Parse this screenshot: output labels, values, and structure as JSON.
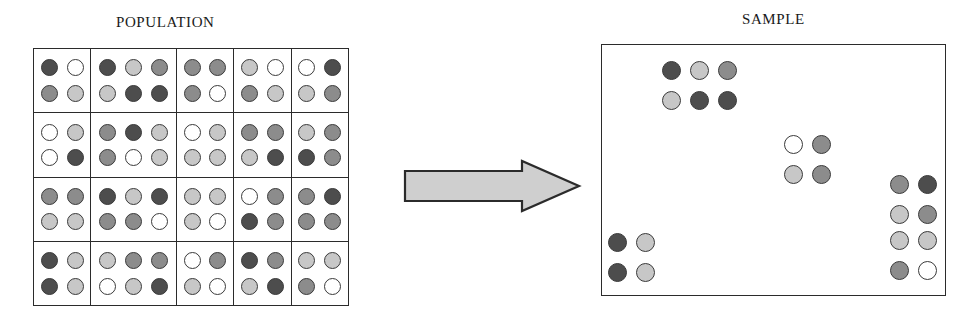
{
  "labels": {
    "population": "POPULATION",
    "sample": "SAMPLE"
  },
  "colors": {
    "shade_dark": "#4d4d4d",
    "shade_mid": "#8c8c8c",
    "shade_light": "#c7c7c7",
    "shade_white": "#ffffff",
    "outline": "#3a3a3a",
    "grid_line": "#2b2b2b",
    "arrow_fill": "#cfcfcf",
    "arrow_stroke": "#2b2b2b",
    "background": "#ffffff"
  },
  "chart_data": {
    "type": "diagram",
    "population": {
      "label": "POPULATION",
      "rows": 4,
      "columns": 5,
      "cluster_widths": [
        2,
        3,
        2,
        2,
        2
      ],
      "total_clusters": 20,
      "units_per_cluster_row": 2,
      "shade_legend": [
        "dark",
        "mid",
        "light",
        "white"
      ],
      "clusters": [
        [
          {
            "id": "r1c1",
            "cols": 2,
            "cells": [
              [
                "dark",
                "white"
              ],
              [
                "mid",
                "light"
              ]
            ]
          },
          {
            "id": "r1c2",
            "cols": 3,
            "cells": [
              [
                "dark",
                "light",
                "mid"
              ],
              [
                "light",
                "dark",
                "dark"
              ]
            ]
          },
          {
            "id": "r1c3",
            "cols": 2,
            "cells": [
              [
                "mid",
                "mid"
              ],
              [
                "mid",
                "white"
              ]
            ]
          },
          {
            "id": "r1c4",
            "cols": 2,
            "cells": [
              [
                "light",
                "white"
              ],
              [
                "mid",
                "light"
              ]
            ]
          },
          {
            "id": "r1c5",
            "cols": 2,
            "cells": [
              [
                "white",
                "dark"
              ],
              [
                "light",
                "mid"
              ]
            ]
          }
        ],
        [
          {
            "id": "r2c1",
            "cols": 2,
            "cells": [
              [
                "white",
                "light"
              ],
              [
                "white",
                "dark"
              ]
            ]
          },
          {
            "id": "r2c2",
            "cols": 3,
            "cells": [
              [
                "mid",
                "dark",
                "light"
              ],
              [
                "mid",
                "white",
                "light"
              ]
            ]
          },
          {
            "id": "r2c3",
            "cols": 2,
            "cells": [
              [
                "white",
                "light"
              ],
              [
                "light",
                "light"
              ]
            ]
          },
          {
            "id": "r2c4",
            "cols": 2,
            "cells": [
              [
                "mid",
                "mid"
              ],
              [
                "light",
                "dark"
              ]
            ]
          },
          {
            "id": "r2c5",
            "cols": 2,
            "cells": [
              [
                "light",
                "mid"
              ],
              [
                "dark",
                "mid"
              ]
            ]
          }
        ],
        [
          {
            "id": "r3c1",
            "cols": 2,
            "cells": [
              [
                "mid",
                "mid"
              ],
              [
                "light",
                "light"
              ]
            ]
          },
          {
            "id": "r3c2",
            "cols": 3,
            "cells": [
              [
                "dark",
                "light",
                "dark"
              ],
              [
                "mid",
                "mid",
                "white"
              ]
            ]
          },
          {
            "id": "r3c3",
            "cols": 2,
            "cells": [
              [
                "light",
                "light"
              ],
              [
                "light",
                "white"
              ]
            ]
          },
          {
            "id": "r3c4",
            "cols": 2,
            "cells": [
              [
                "white",
                "mid"
              ],
              [
                "dark",
                "mid"
              ]
            ]
          },
          {
            "id": "r3c5",
            "cols": 2,
            "cells": [
              [
                "mid",
                "dark"
              ],
              [
                "mid",
                "mid"
              ]
            ]
          }
        ],
        [
          {
            "id": "r4c1",
            "cols": 2,
            "cells": [
              [
                "dark",
                "light"
              ],
              [
                "dark",
                "light"
              ]
            ]
          },
          {
            "id": "r4c2",
            "cols": 3,
            "cells": [
              [
                "light",
                "mid",
                "mid"
              ],
              [
                "white",
                "light",
                "dark"
              ]
            ]
          },
          {
            "id": "r4c3",
            "cols": 2,
            "cells": [
              [
                "white",
                "mid"
              ],
              [
                "light",
                "white"
              ]
            ]
          },
          {
            "id": "r4c4",
            "cols": 2,
            "cells": [
              [
                "dark",
                "mid"
              ],
              [
                "light",
                "dark"
              ]
            ]
          },
          {
            "id": "r4c5",
            "cols": 2,
            "cells": [
              [
                "light",
                "light"
              ],
              [
                "mid",
                "white"
              ]
            ]
          }
        ]
      ]
    },
    "arrow": {
      "direction": "right",
      "fill": "#cfcfcf",
      "stroke": "#2b2b2b"
    },
    "sample": {
      "label": "SAMPLE",
      "selected_clusters": 5,
      "groups": [
        {
          "id": "sample-cluster-top-left",
          "source": "r1c2",
          "x": 60,
          "y": 16,
          "cells": [
            [
              "dark",
              "light",
              "mid"
            ],
            [
              "light",
              "dark",
              "dark"
            ]
          ]
        },
        {
          "id": "sample-cluster-middle",
          "source": "r2c3",
          "x": 182,
          "y": 90,
          "cells": [
            [
              "white",
              "mid"
            ],
            [
              "light",
              "mid"
            ]
          ]
        },
        {
          "id": "sample-cluster-bottom-left",
          "source": "r4c1",
          "x": 6,
          "y": 188,
          "cells": [
            [
              "dark",
              "light"
            ],
            [
              "dark",
              "light"
            ]
          ]
        },
        {
          "id": "sample-cluster-right-upper",
          "source": "r3c5",
          "x": 288,
          "y": 130,
          "cells": [
            [
              "mid",
              "dark"
            ],
            [
              "light",
              "mid"
            ]
          ]
        },
        {
          "id": "sample-cluster-right-lower",
          "source": "r4c5",
          "x": 288,
          "y": 186,
          "cells": [
            [
              "light",
              "light"
            ],
            [
              "mid",
              "white"
            ]
          ]
        }
      ]
    }
  }
}
